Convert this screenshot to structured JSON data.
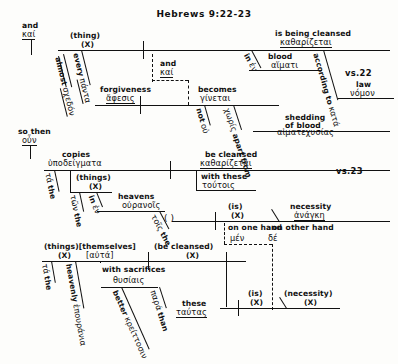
{
  "document": {
    "title": "Hebrews 9:22-23",
    "type": "greek-syntactical-sentence-diagram"
  },
  "verse_labels": {
    "vs22": "vs.22",
    "vs23": "vs.23"
  },
  "clause1": {
    "conjunction": {
      "english": "and",
      "greek": "καί"
    },
    "subject": {
      "english": "(thing)",
      "placeholder": "(X)"
    },
    "subject_mods": [
      {
        "english": "every",
        "greek": "πάντα"
      },
      {
        "english": "almost",
        "greek": "σχεδόν"
      }
    ],
    "verb": {
      "english": "is being cleansed",
      "greek": "καθαρίζεται"
    },
    "prep_blood": {
      "english": "in",
      "greek": "ἐν"
    },
    "obj_blood": {
      "english": "blood",
      "greek": "αἵματι"
    },
    "prep_according": {
      "english": "according to",
      "greek": "κατά"
    },
    "obj_law": {
      "english": "law",
      "greek": "νόμον"
    },
    "joiner": {
      "english": "and",
      "greek": "καί"
    },
    "subject2": {
      "english": "forgiveness",
      "greek": "ἄφεσις"
    },
    "verb2": {
      "english": "becomes",
      "greek": "γίνεται"
    },
    "neg": {
      "english": "not",
      "greek": "οὐ"
    },
    "prep_apart": {
      "english": "apart from",
      "greek": "χωρίς"
    },
    "obj_shedding": {
      "english": "shedding of blood",
      "greek": "αἱματεχυσίας"
    }
  },
  "clause2": {
    "conjunction": {
      "english": "so then",
      "greek": "οὖν"
    },
    "subject": {
      "english": "copies",
      "greek": "ὑποδείγματα"
    },
    "art1": {
      "english": "the",
      "greek": "τά"
    },
    "subject_appos": {
      "english": "(things)",
      "placeholder": "(X)"
    },
    "art2": {
      "english": "the",
      "greek": "τῶν"
    },
    "prep_in": {
      "english": "in",
      "greek": "ἐν"
    },
    "obj_heavens": {
      "english": "heavens",
      "greek": "οὐρανοῖς"
    },
    "art3": {
      "english": "the",
      "greek": "τοῖς"
    },
    "verb": {
      "english": "be cleansed",
      "greek": "καθαρίζεται"
    },
    "prep_with": {
      "english": "with these",
      "greek": "τούτοις"
    },
    "copula": {
      "english": "(is)",
      "placeholder": "(X)"
    },
    "predicate": {
      "english": "necessity",
      "greek": "ἀνάγκη"
    },
    "correlative": {
      "english_left": "on one hand",
      "english_right": "on other hand",
      "greek_left": "μέν",
      "greek_right": "δέ"
    }
  },
  "clause3": {
    "subject": {
      "english": "(things)[themselves]",
      "placeholder": "(X)",
      "greek": "[αὐτά]"
    },
    "art1": {
      "english": "the",
      "greek": "τά"
    },
    "adj_heavenly": {
      "english": "heavenly",
      "greek": "ἐπουράνια"
    },
    "verb": {
      "english": "(be cleansed)",
      "placeholder": "(X)"
    },
    "prep_with": {
      "english": "with sacrifices",
      "greek": "θυσίαις"
    },
    "adj_better": {
      "english": "better",
      "greek": "κρείττοσιν"
    },
    "prep_than": {
      "english": "than",
      "greek": "παρά"
    },
    "obj_these": {
      "english": "these",
      "greek": "ταύτας"
    },
    "copula": {
      "english": "(is)",
      "placeholder": "(X)"
    },
    "predicate": {
      "english": "(necessity)",
      "placeholder": "(X)"
    }
  },
  "colors": {
    "ink": "#111111",
    "paper": "#fdfdfb"
  }
}
